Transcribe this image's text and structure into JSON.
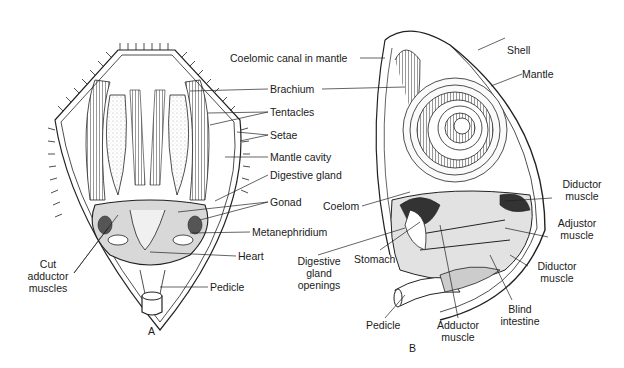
{
  "figure": {
    "panel_a": {
      "letter": "A",
      "labels": {
        "brachium": "Brachium",
        "tentacles": "Tentacles",
        "setae": "Setae",
        "mantle_cavity": "Mantle cavity",
        "digestive_gland": "Digestive gland",
        "gonad": "Gonad",
        "metanephridium": "Metanephridium",
        "heart": "Heart",
        "pedicle": "Pedicle",
        "cut_adductor_1": "Cut",
        "cut_adductor_2": "adductor",
        "cut_adductor_3": "muscles"
      }
    },
    "panel_b": {
      "letter": "B",
      "labels": {
        "coelomic_canal": "Coelomic canal in mantle",
        "shell": "Shell",
        "mantle": "Mantle",
        "coelom": "Coelom",
        "stomach": "Stomach",
        "dig_gland_open_1": "Digestive",
        "dig_gland_open_2": "gland",
        "dig_gland_open_3": "openings",
        "diductor_upper_1": "Diductor",
        "diductor_upper_2": "muscle",
        "adjustor_1": "Adjustor",
        "adjustor_2": "muscle",
        "diductor_lower_1": "Diductor",
        "diductor_lower_2": "muscle",
        "blind_intestine_1": "Blind",
        "blind_intestine_2": "intestine",
        "adductor_1": "Adductor",
        "adductor_2": "muscle",
        "pedicle": "Pedicle"
      }
    }
  }
}
